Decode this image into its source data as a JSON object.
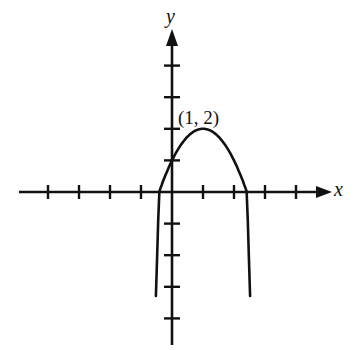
{
  "chart_data": {
    "type": "line",
    "title": "",
    "xlabel": "x",
    "ylabel": "y",
    "function": "y = -(x - 1)^2 + 2",
    "series": [
      {
        "name": "parabola",
        "x": [
          -0.52,
          -0.414,
          0,
          0.5,
          1,
          1.5,
          2,
          2.414,
          2.52
        ],
        "values": [
          -0.31,
          0,
          1,
          1.75,
          2,
          1.75,
          1,
          0,
          -0.31
        ]
      }
    ],
    "curve_domain": [
      -0.52,
      2.52
    ],
    "curve_range_min": -3.3,
    "annotations": [
      {
        "text": "(1, 2)",
        "x": 1,
        "y": 2
      }
    ],
    "x_ticks": [
      -4,
      -3,
      -2,
      -1,
      1,
      2,
      3,
      4
    ],
    "y_ticks": [
      -4,
      -3,
      -2,
      -1,
      1,
      2,
      3,
      4
    ],
    "xlim": [
      -4.8,
      5.2
    ],
    "ylim": [
      -4.5,
      5.2
    ],
    "grid": false,
    "legend": "none",
    "colors": {
      "ink": "#111111",
      "background": "#ffffff"
    }
  }
}
